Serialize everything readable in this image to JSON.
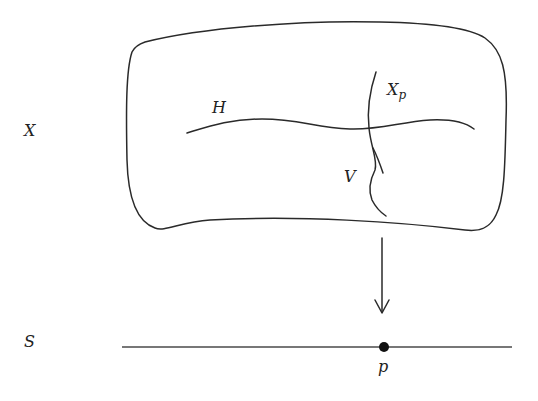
{
  "diagram": {
    "type": "fibration-sketch",
    "labels": {
      "total_space": "X",
      "base_space": "S",
      "horizontal_curve": "H",
      "vertical_curve": "V",
      "fiber_main": "X",
      "fiber_sub": "p",
      "base_point": "p"
    },
    "elements": [
      {
        "id": "surface-X",
        "kind": "rounded-blob",
        "label": "X"
      },
      {
        "id": "curve-H",
        "kind": "curve",
        "label": "H",
        "orientation": "horizontal"
      },
      {
        "id": "fiber-Xp",
        "kind": "curve",
        "label": "X_p",
        "orientation": "vertical"
      },
      {
        "id": "curve-V",
        "kind": "curve",
        "label": "V",
        "orientation": "vertical",
        "crosses": "fiber-Xp"
      },
      {
        "id": "projection-arrow",
        "kind": "arrow",
        "direction": "down"
      },
      {
        "id": "base-line-S",
        "kind": "line",
        "label": "S"
      },
      {
        "id": "point-p",
        "kind": "point",
        "label": "p",
        "on": "base-line-S"
      }
    ],
    "colors": {
      "stroke": "#2a2a2a",
      "point": "#111111",
      "background": "#ffffff"
    }
  }
}
